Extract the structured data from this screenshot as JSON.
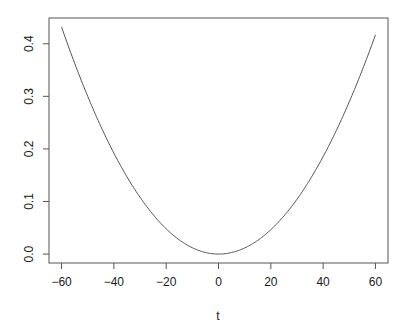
{
  "chart_data": {
    "type": "line",
    "title": "",
    "xlabel": "t",
    "ylabel": "",
    "xlim": [
      -64.8,
      64.8
    ],
    "ylim": [
      -0.017,
      0.449
    ],
    "x_ticks": [
      -60,
      -40,
      -20,
      0,
      20,
      40,
      60
    ],
    "x_tick_labels": [
      "−60",
      "−40",
      "−20",
      "0",
      "20",
      "40",
      "60"
    ],
    "y_ticks": [
      0.0,
      0.1,
      0.2,
      0.3,
      0.4
    ],
    "y_tick_labels": [
      "0.0",
      "0.1",
      "0.2",
      "0.3",
      "0.4"
    ],
    "grid": false,
    "legend": null,
    "series": [
      {
        "name": "curve",
        "color": "#555555",
        "x": [
          -60,
          -50,
          -40,
          -30,
          -20,
          -10,
          0,
          10,
          20,
          30,
          40,
          50,
          60
        ],
        "y": [
          0.432,
          0.298,
          0.19,
          0.107,
          0.047,
          0.012,
          0.0,
          0.012,
          0.046,
          0.104,
          0.184,
          0.288,
          0.417
        ]
      }
    ]
  }
}
